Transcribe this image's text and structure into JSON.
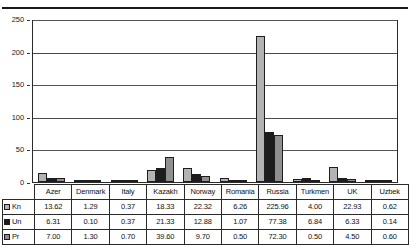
{
  "chart_data": {
    "type": "bar",
    "title": "",
    "xlabel": "",
    "ylabel": "",
    "ylim": [
      0,
      250
    ],
    "yticks": [
      0,
      50,
      100,
      150,
      200,
      250
    ],
    "grid": true,
    "legend_position": "table-row-headers",
    "categories": [
      "Azer",
      "Denmark",
      "Italy",
      "Kazakh",
      "Norway",
      "Romania",
      "Russia",
      "Turkmen",
      "UK",
      "Uzbek"
    ],
    "series": [
      {
        "name": "Kn",
        "color": "#b3b3b3",
        "values": [
          13.62,
          1.29,
          0.37,
          18.33,
          22.32,
          6.26,
          225.96,
          4.0,
          22.93,
          0.62
        ]
      },
      {
        "name": "Un",
        "color": "#1c1c1c",
        "values": [
          6.31,
          0.1,
          0.37,
          21.33,
          12.88,
          1.07,
          77.38,
          6.84,
          6.33,
          0.14
        ]
      },
      {
        "name": "Pr",
        "color": "#8f8f8f",
        "values": [
          7.0,
          1.3,
          0.7,
          39.6,
          9.7,
          0.5,
          72.3,
          0.5,
          4.5,
          0.6
        ]
      }
    ]
  },
  "table": {
    "column_headers": [
      "Azer",
      "Denmark",
      "Italy",
      "Kazakh",
      "Norway",
      "Romania",
      "Russia",
      "Turkmen",
      "UK",
      "Uzbek"
    ],
    "rows": [
      {
        "label": "Kn",
        "swatch": "light-gray-swatch",
        "cells": [
          "13.62",
          "1.29",
          "0.37",
          "18.33",
          "22.32",
          "6.26",
          "225.96",
          "4.00",
          "22.93",
          "0.62"
        ]
      },
      {
        "label": "Un",
        "swatch": "black-swatch",
        "cells": [
          "6.31",
          "0.10",
          "0.37",
          "21.33",
          "12.88",
          "1.07",
          "77.38",
          "6.84",
          "6.33",
          "0.14"
        ]
      },
      {
        "label": "Pr",
        "swatch": "medium-gray-swatch",
        "cells": [
          "7.00",
          "1.30",
          "0.70",
          "39.60",
          "9.70",
          "0.50",
          "72.30",
          "0.50",
          "4.50",
          "0.60"
        ]
      }
    ]
  },
  "axis": {
    "y_tick_labels": [
      "250",
      "200",
      "150",
      "100",
      "50",
      "0"
    ]
  }
}
